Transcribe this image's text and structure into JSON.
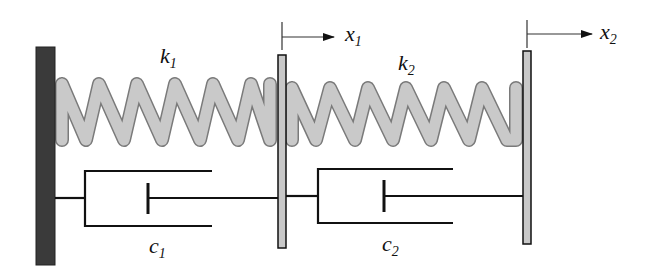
{
  "diagram": {
    "labels": {
      "k1": {
        "main": "k",
        "sub": "1"
      },
      "k2": {
        "main": "k",
        "sub": "2"
      },
      "c1": {
        "main": "c",
        "sub": "1"
      },
      "c2": {
        "main": "c",
        "sub": "2"
      },
      "x1": {
        "main": "x",
        "sub": "1"
      },
      "x2": {
        "main": "x",
        "sub": "2"
      }
    },
    "colors": {
      "wall": "#3a3a3a",
      "plate": "#c8c8c8",
      "spring_fill": "#c9c9c9",
      "spring_stroke": "#7a7a7a",
      "line": "#111111"
    },
    "components": [
      {
        "type": "fixed-wall"
      },
      {
        "type": "spring",
        "label": "k1",
        "coils": 6
      },
      {
        "type": "damper",
        "label": "c1"
      },
      {
        "type": "mass-plate",
        "displacement": "x1"
      },
      {
        "type": "spring",
        "label": "k2",
        "coils": 6
      },
      {
        "type": "damper",
        "label": "c2"
      },
      {
        "type": "mass-plate",
        "displacement": "x2"
      }
    ]
  }
}
